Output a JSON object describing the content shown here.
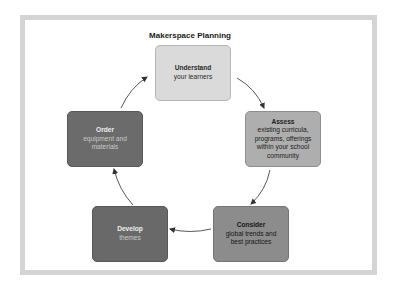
{
  "diagram": {
    "title": "Makerspace Planning",
    "type": "cycle",
    "steps": [
      {
        "heading": "Understand",
        "body": [
          "your learners"
        ],
        "fill": "#dadada"
      },
      {
        "heading": "Assess",
        "body": [
          "existing curricula,",
          "programs, offerings",
          "within your school",
          "community"
        ],
        "fill": "#aeaeae"
      },
      {
        "heading": "Consider",
        "body": [
          "global trends and",
          "best practices"
        ],
        "fill": "#8c8c8c"
      },
      {
        "heading": "Develop",
        "body": [
          "themes"
        ],
        "fill": "#696969"
      },
      {
        "heading": "Order",
        "body": [
          "equipment and",
          "materials"
        ],
        "fill": "#6b6b6b"
      }
    ],
    "flow": [
      "Understand -> Assess",
      "Assess -> Consider",
      "Consider -> Develop",
      "Develop -> Order",
      "Order -> Understand"
    ],
    "frame_color": "#d4d4d4",
    "arrow_color": "#333333"
  }
}
